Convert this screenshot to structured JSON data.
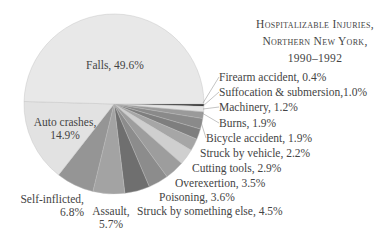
{
  "chart_data": {
    "type": "pie",
    "title": "Hospitalizable Injuries, Northern New York, 1990–1992",
    "title_lines": [
      "Hospitalizable Injuries,",
      "Northern New York,",
      "1990–1992"
    ],
    "start_angle": "3 o'clock, clockwise",
    "slices": [
      {
        "label": "Firearm accident",
        "value": 0.4,
        "display": "Firearm accident, 0.4%",
        "color": "#1a1a1a"
      },
      {
        "label": "Suffocation & submersion",
        "value": 1.0,
        "display": "Suffocation & submersion,1.0%",
        "color": "#e4e4e4"
      },
      {
        "label": "Machinery",
        "value": 1.2,
        "display": "Machinery, 1.2%",
        "color": "#9a9a9a"
      },
      {
        "label": "Burns",
        "value": 1.9,
        "display": "Burns, 1.9%",
        "color": "#8a8a8a"
      },
      {
        "label": "Bicycle accident",
        "value": 1.9,
        "display": "Bicycle accident, 1.9%",
        "color": "#7e7e7e"
      },
      {
        "label": "Struck by vehicle",
        "value": 2.2,
        "display": "Struck by vehicle, 2.2%",
        "color": "#a6a6a6"
      },
      {
        "label": "Cutting tools",
        "value": 2.9,
        "display": "Cutting tools, 2.9%",
        "color": "#cfcfcf"
      },
      {
        "label": "Overexertion",
        "value": 3.5,
        "display": "Overexertion, 3.5%",
        "color": "#9d9d9d"
      },
      {
        "label": "Poisoning",
        "value": 3.6,
        "display": "Poisoning, 3.6%",
        "color": "#8c8c8c"
      },
      {
        "label": "Struck by something else",
        "value": 4.5,
        "display": "Struck by something else, 4.5%",
        "color": "#6f6f6f"
      },
      {
        "label": "Assault",
        "value": 5.7,
        "display": "Assault, 5.7%",
        "color": "#a3a3a3"
      },
      {
        "label": "Self-inflicted",
        "value": 6.8,
        "display": "Self-inflicted, 6.8%",
        "color": "#959595"
      },
      {
        "label": "Auto crashes",
        "value": 14.9,
        "display": "Auto crashes, 14.9%",
        "color": "#e2e2e2"
      },
      {
        "label": "Falls",
        "value": 49.6,
        "display": "Falls, 49.6%",
        "color": "#e8e8e8"
      }
    ]
  },
  "labels": {
    "falls": "Falls, 49.6%",
    "auto_1": "Auto crashes,",
    "auto_2": "14.9%",
    "self_1": "Self-inflicted,",
    "self_2": "6.8%",
    "assault_1": "Assault,",
    "assault_2": "5.7%",
    "struck_else": "Struck by something else, 4.5%",
    "poisoning": "Poisoning, 3.6%",
    "overexertion": "Overexertion, 3.5%",
    "cutting": "Cutting tools, 2.9%",
    "struck_vehicle": "Struck by vehicle, 2.2%",
    "bicycle": "Bicycle accident, 1.9%",
    "burns": "Burns, 1.9%",
    "machinery": "Machinery, 1.2%",
    "suffocation": "Suffocation & submersion,1.0%",
    "firearm": "Firearm accident, 0.4%"
  }
}
